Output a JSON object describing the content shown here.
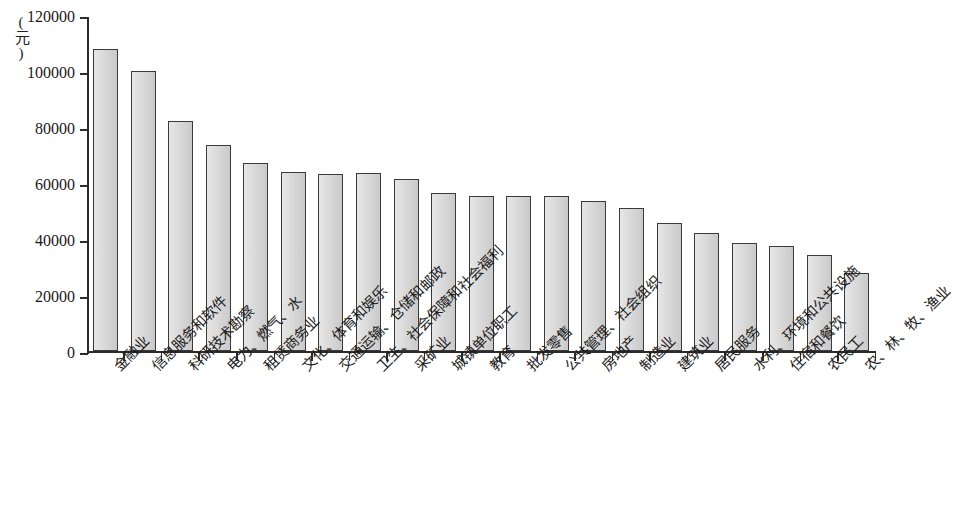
{
  "chart_data": {
    "type": "bar",
    "title": "",
    "subtitle": "",
    "xlabel": "",
    "ylabel": "(元)",
    "ylim": [
      0,
      120000
    ],
    "ytick_labels": [
      "0",
      "20000",
      "40000",
      "60000",
      "80000",
      "100000",
      "120000"
    ],
    "ytick_values": [
      0,
      20000,
      40000,
      60000,
      80000,
      100000,
      120000
    ],
    "grid": false,
    "legend": false,
    "categories": [
      "金融业",
      "信息服务和软件",
      "科研技术勘察",
      "电力、燃气、水",
      "租赁商务业",
      "文化、体育和娱乐",
      "交通运输、仓储和邮政",
      "卫生、社会保障和社会福利",
      "采矿业",
      "城镇单位职工",
      "教育",
      "批发零售",
      "公共管理、社会组织",
      "房地产",
      "制造业",
      "建筑业",
      "居民服务",
      "水利、环境和公共设施",
      "住宿和餐饮",
      "农民工",
      "农、林、牧、渔业"
    ],
    "values": [
      108000,
      100000,
      82000,
      73500,
      67000,
      64000,
      63200,
      63400,
      61500,
      56500,
      55500,
      55300,
      55400,
      53400,
      51200,
      45700,
      42000,
      38500,
      37500,
      34200,
      27700
    ]
  },
  "colors": {
    "bar_fill": "#d2d2d2",
    "bar_stroke": "#3a3a3a",
    "axis": "#2b2b2b",
    "text": "#1a1a1a",
    "background": "#ffffff"
  }
}
